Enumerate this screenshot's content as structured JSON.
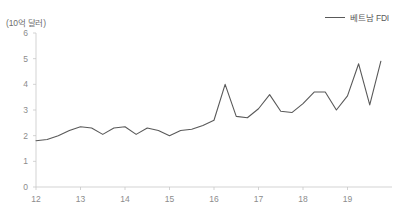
{
  "chart_data": {
    "type": "line",
    "title": "",
    "subtitle": "",
    "unit_label": "(10억 달러)",
    "xlabel": "",
    "ylabel": "",
    "ylim": [
      0,
      6
    ],
    "xlim": [
      12,
      20
    ],
    "ytick_labels": [
      "0",
      "1",
      "2",
      "3",
      "4",
      "5",
      "6"
    ],
    "ytick_values": [
      0,
      1,
      2,
      3,
      4,
      5,
      6
    ],
    "xtick_labels": [
      "12",
      "13",
      "14",
      "15",
      "16",
      "17",
      "18",
      "19"
    ],
    "xtick_values": [
      12,
      13,
      14,
      15,
      16,
      17,
      18,
      19
    ],
    "grid": false,
    "legend_position": "top-right",
    "legend": [
      "베트남 FDI"
    ],
    "series": [
      {
        "name": "베트남 FDI",
        "color": "#595959",
        "x": [
          12.0,
          12.25,
          12.5,
          12.75,
          13.0,
          13.25,
          13.5,
          13.75,
          14.0,
          14.25,
          14.5,
          14.75,
          15.0,
          15.25,
          15.5,
          15.75,
          16.0,
          16.25,
          16.5,
          16.75,
          17.0,
          17.25,
          17.5,
          17.75,
          18.0,
          18.25,
          18.5,
          18.75,
          19.0,
          19.25,
          19.5,
          19.75
        ],
        "values": [
          1.8,
          1.85,
          2.0,
          2.2,
          2.35,
          2.3,
          2.05,
          2.3,
          2.35,
          2.05,
          2.3,
          2.2,
          2.0,
          2.2,
          2.25,
          2.4,
          2.6,
          4.0,
          2.75,
          2.7,
          3.05,
          3.6,
          2.95,
          2.9,
          3.25,
          3.7,
          3.7,
          3.0,
          3.55,
          4.8,
          3.2,
          4.9
        ]
      }
    ]
  },
  "legend": {
    "items": [
      {
        "label": "베트남 FDI",
        "color": "#595959"
      }
    ]
  },
  "axes": {
    "unit_label": "(10억 달러)"
  },
  "colors": {
    "line": "#595959",
    "axis": "#c8c8c8",
    "tick_text": "#8c8c8c",
    "background": "#ffffff"
  }
}
